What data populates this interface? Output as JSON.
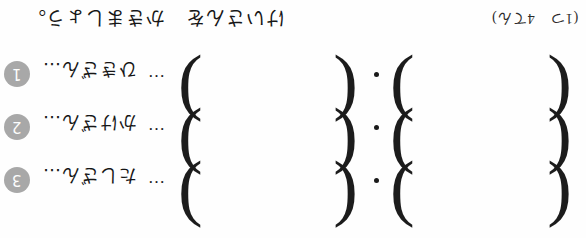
{
  "page": {
    "orientation": "rotated-180",
    "background": "#fefefe",
    "ink_color": "#1a1a1a",
    "badge_color": "#a8a8a8"
  },
  "header": {
    "instruction": "けいさんを　かきましょう。",
    "note": "(1つ　4てん)"
  },
  "symbols": {
    "ellipsis": "…",
    "paren_open": "(",
    "paren_close": ")",
    "separator_dot": "•"
  },
  "problems": [
    {
      "number": "1",
      "badge": "➊",
      "label": "ひきざん…",
      "answer_1": "",
      "answer_2": ""
    },
    {
      "number": "2",
      "badge": "➋",
      "label": "かけざん…",
      "answer_1": "",
      "answer_2": ""
    },
    {
      "number": "3",
      "badge": "➌",
      "label": "たしざん…",
      "answer_1": "",
      "answer_2": ""
    }
  ]
}
